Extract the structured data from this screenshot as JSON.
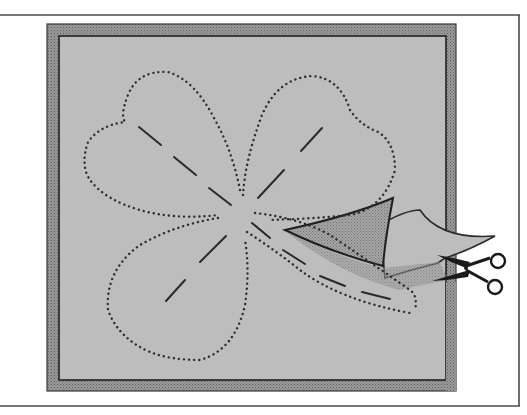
{
  "figure": {
    "description": "Illustration: cutting out a four-leaf shamrock pattern traced with dotted outline on gray fabric, scissors trimming along the stem with a folded flap",
    "colors": {
      "background": "#ffffff",
      "outer_frame_line": "#4a4a4a",
      "board_border": "#8c8c8c",
      "board_border_dark": "#3a3a3a",
      "fabric": "#bdbdbd",
      "flap_shadow": "#8f8f8f",
      "stitch_dots": "#2e2e2e",
      "fold_lines": "#2a2a2a",
      "scissors": "#1a1a1a"
    },
    "elements": {
      "outer_frame": "outer-frame",
      "board": "board",
      "shamrock_outline": "dotted-shamrock-outline",
      "leaf_guides": "dashed-leaf-guides",
      "cut_flap": "cut-flap",
      "scissors": "scissors-icon"
    }
  }
}
